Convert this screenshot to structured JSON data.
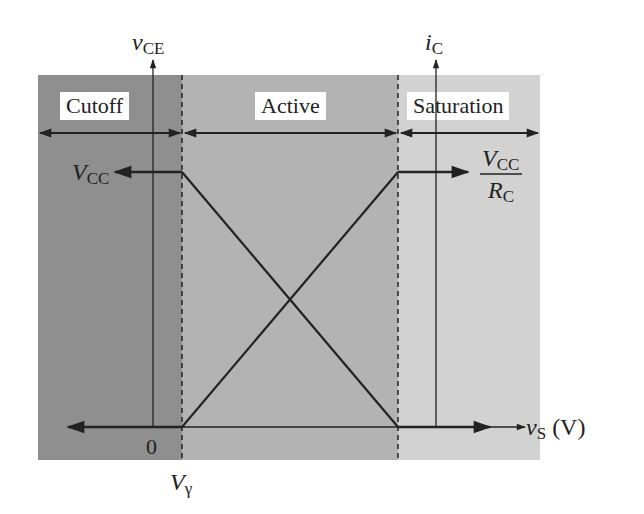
{
  "regions": [
    {
      "id": "cutoff",
      "label": "Cutoff",
      "color": "#8f8f8f"
    },
    {
      "id": "active",
      "label": "Active",
      "color": "#b3b3b3"
    },
    {
      "id": "saturation",
      "label": "Saturation",
      "color": "#d2d2d2"
    }
  ],
  "axes": {
    "left_y": {
      "var": "v",
      "sub": "CE"
    },
    "right_y": {
      "var": "i",
      "sub": "C"
    },
    "x": {
      "var": "v",
      "sub": "S",
      "unit": "(V)"
    },
    "origin": "0"
  },
  "annotations": {
    "vcc": {
      "var": "V",
      "sub": "CC"
    },
    "vcc_over_rc": {
      "num_var": "V",
      "num_sub": "CC",
      "den_var": "R",
      "den_sub": "C"
    },
    "v_gamma": {
      "var": "V",
      "sub": "γ"
    }
  },
  "curves": [
    {
      "name": "vCE",
      "description": "V_CC for vS < Vγ, decreases linearly in active region to 0 at saturation boundary"
    },
    {
      "name": "iC",
      "description": "0 for vS < Vγ, increases linearly in active region to V_CC/R_C at saturation boundary"
    }
  ]
}
